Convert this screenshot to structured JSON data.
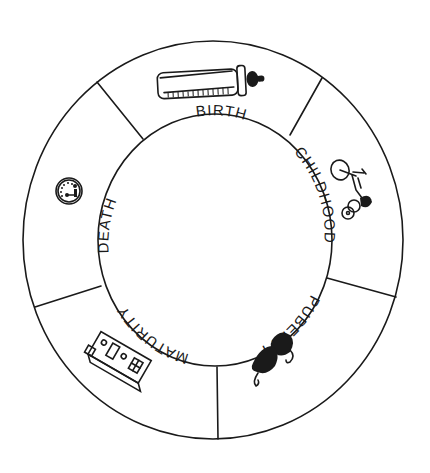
{
  "diagram": {
    "type": "life-cycle-wheel",
    "stages": [
      {
        "label": "BIRTH",
        "icon": "baby-bottle-icon"
      },
      {
        "label": "CHILDHOOD",
        "icon": "tricycle-icon"
      },
      {
        "label": "PUBERTY",
        "icon": "bra-icon"
      },
      {
        "label": "MATURITY",
        "icon": "house-icon"
      },
      {
        "label": "DEATH",
        "icon": "gauge-icon"
      }
    ],
    "colors": {
      "ink": "#1a1a1a",
      "background": "#ffffff"
    }
  }
}
